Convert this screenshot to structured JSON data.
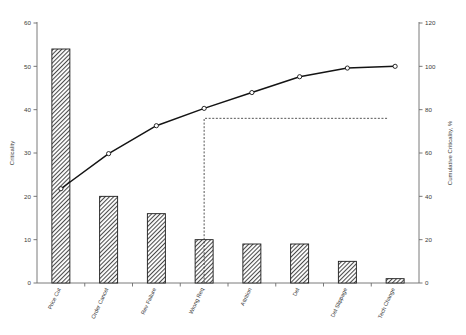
{
  "chart_data": {
    "type": "bar",
    "title": "",
    "subtitle": "",
    "categories": [
      "Price Cut",
      "Order Cancel",
      "Rev Failure",
      "Wrong Req",
      "Attrition",
      "Del",
      "Del Slippage",
      "Tech Change"
    ],
    "series": [
      {
        "name": "Criticality",
        "type": "bar",
        "axis": "left",
        "values": [
          54,
          20,
          16,
          10,
          9,
          9,
          5,
          1
        ]
      },
      {
        "name": "Cumulative Criticality, %",
        "type": "line",
        "axis": "right",
        "values": [
          43.5,
          59.7,
          72.6,
          80.6,
          87.9,
          95.2,
          99.2,
          100.0
        ]
      }
    ],
    "xlabel": "",
    "ylabel": "Criticality",
    "y2label": "Cumulative Criticality, %",
    "ylim": [
      0,
      60
    ],
    "y2lim": [
      0,
      120
    ],
    "yticks": [
      0,
      10,
      20,
      30,
      40,
      50,
      60
    ],
    "y2ticks": [
      0,
      20,
      40,
      60,
      80,
      100,
      120
    ],
    "ytick_labels": [
      "0",
      "10",
      "20",
      "30",
      "40",
      "50",
      "60"
    ],
    "y2tick_labels": [
      "0",
      "20",
      "40",
      "60",
      "80",
      "100",
      "120"
    ],
    "grid": false,
    "legend": "none",
    "annotations": [
      {
        "name": "eighty-percent-reference",
        "type": "dashed-elbow",
        "from_category_index": 3,
        "value_percent": 76,
        "extends_to": "right-axis"
      }
    ],
    "colors": {
      "bar_fill": "#6e6e6e",
      "bar_edge": "#1c1c1c",
      "line": "#141414",
      "marker_fill": "#ffffff",
      "axis": "#6b6b6b",
      "text": "#3a3a3a",
      "reference": "#2a2a2a",
      "background": "#ffffff"
    }
  }
}
